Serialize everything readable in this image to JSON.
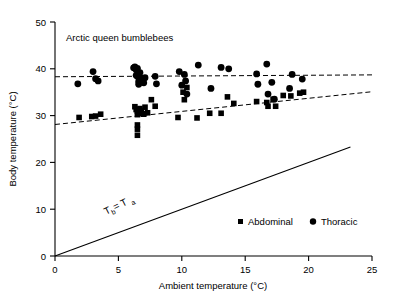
{
  "chart_data": {
    "type": "scatter",
    "title": "Arctic queen bumblebees",
    "xlabel": "Ambient temperature (°C)",
    "ylabel": "Body temperature (°C)",
    "xlim": [
      0,
      25
    ],
    "ylim": [
      0,
      50
    ],
    "xticks": [
      0,
      5,
      10,
      15,
      20,
      25
    ],
    "yticks": [
      0,
      10,
      20,
      30,
      40,
      50
    ],
    "xtick_labels": [
      "0",
      "5",
      "10",
      "15",
      "20",
      "25"
    ],
    "ytick_labels": [
      "0",
      "10",
      "20",
      "30",
      "40",
      "50"
    ],
    "grid": false,
    "legend_position": "inside-bottom-right",
    "marker_color": "#000000",
    "series": [
      {
        "name": "Abdominal",
        "marker": "square",
        "points": [
          [
            1.9,
            29.6
          ],
          [
            2.9,
            29.8
          ],
          [
            3.2,
            29.9
          ],
          [
            3.6,
            30.3
          ],
          [
            6.3,
            31.9
          ],
          [
            6.4,
            31.3
          ],
          [
            6.5,
            30.9
          ],
          [
            6.5,
            30.2
          ],
          [
            6.5,
            28.0
          ],
          [
            6.5,
            27.1
          ],
          [
            6.5,
            25.8
          ],
          [
            6.7,
            31.5
          ],
          [
            6.8,
            31.0
          ],
          [
            6.9,
            30.4
          ],
          [
            7.0,
            30.3
          ],
          [
            7.1,
            31.8
          ],
          [
            7.3,
            30.6
          ],
          [
            7.6,
            33.4
          ],
          [
            7.9,
            32.0
          ],
          [
            9.7,
            29.6
          ],
          [
            10.1,
            35.0
          ],
          [
            10.2,
            33.4
          ],
          [
            10.4,
            36.0
          ],
          [
            11.2,
            29.5
          ],
          [
            12.2,
            30.5
          ],
          [
            13.1,
            30.5
          ],
          [
            13.6,
            34.0
          ],
          [
            14.1,
            32.6
          ],
          [
            15.9,
            33.0
          ],
          [
            16.7,
            32.8
          ],
          [
            16.8,
            32.0
          ],
          [
            17.2,
            33.5
          ],
          [
            17.4,
            32.0
          ],
          [
            18.0,
            34.3
          ],
          [
            18.6,
            34.2
          ],
          [
            19.3,
            34.8
          ],
          [
            19.6,
            35.0
          ]
        ]
      },
      {
        "name": "Thoracic",
        "marker": "circle",
        "points": [
          [
            1.8,
            36.8
          ],
          [
            3.0,
            39.4
          ],
          [
            3.2,
            37.9
          ],
          [
            3.4,
            37.4
          ],
          [
            6.2,
            40.2
          ],
          [
            6.3,
            40.4
          ],
          [
            6.4,
            39.8
          ],
          [
            6.4,
            38.6
          ],
          [
            6.5,
            40.1
          ],
          [
            6.5,
            38.4
          ],
          [
            6.6,
            37.3
          ],
          [
            6.6,
            36.7
          ],
          [
            6.7,
            39.2
          ],
          [
            6.8,
            38.0
          ],
          [
            6.9,
            37.2
          ],
          [
            7.0,
            37.0
          ],
          [
            7.1,
            38.1
          ],
          [
            7.9,
            38.4
          ],
          [
            8.0,
            36.8
          ],
          [
            9.8,
            39.4
          ],
          [
            10.0,
            36.5
          ],
          [
            10.2,
            38.8
          ],
          [
            10.3,
            37.4
          ],
          [
            10.4,
            34.6
          ],
          [
            11.3,
            40.8
          ],
          [
            12.3,
            35.8
          ],
          [
            13.1,
            40.3
          ],
          [
            13.7,
            40.0
          ],
          [
            15.9,
            38.9
          ],
          [
            16.0,
            36.7
          ],
          [
            16.7,
            41.0
          ],
          [
            16.8,
            34.6
          ],
          [
            17.1,
            37.1
          ],
          [
            17.3,
            33.5
          ],
          [
            18.5,
            35.8
          ],
          [
            18.7,
            38.8
          ],
          [
            19.5,
            37.8
          ]
        ]
      }
    ],
    "fit_lines": [
      {
        "name": "thoracic-regression",
        "style": "dashed",
        "x0": 0.0,
        "y0": 38.3,
        "x1": 25.0,
        "y1": 38.7
      },
      {
        "name": "abdominal-regression",
        "style": "dashed",
        "x0": 0.0,
        "y0": 28.1,
        "x1": 25.0,
        "y1": 35.1
      }
    ],
    "reference_line": {
      "name": "identity-line",
      "style": "solid",
      "x0": 0.0,
      "y0": 0.0,
      "x1": 23.3,
      "y1": 23.3
    },
    "annotations": [
      {
        "name": "tb-equals-ta",
        "text_main": "T",
        "text_sub1": "b",
        "text_eq": " = T",
        "text_sub2": "a",
        "full": "Tb = Ta",
        "x": 5.2,
        "y": 8.0,
        "rotation": -26
      }
    ]
  }
}
